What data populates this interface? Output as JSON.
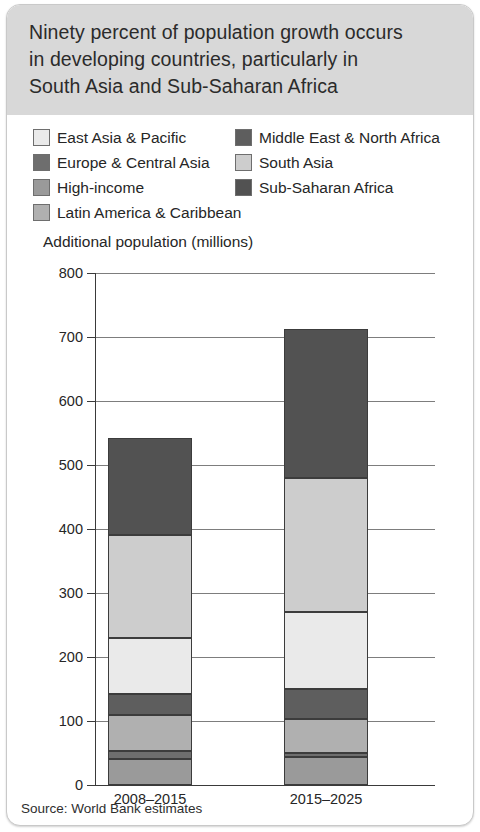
{
  "card": {
    "title": "Ninety percent of population growth occurs in developing countries, particularly in South Asia and Sub-Saharan Africa",
    "title_lines": [
      "Ninety percent of population growth occurs",
      "in developing countries, particularly in",
      "South Asia and Sub-Saharan Africa"
    ],
    "source": "Source: World Bank estimates",
    "title_band_color": "#d8d8d8"
  },
  "legend": {
    "left_column": [
      {
        "label": "East Asia & Pacific",
        "color": "#eaeaea"
      },
      {
        "label": "Europe & Central Asia",
        "color": "#6e6e6e"
      },
      {
        "label": "High-income",
        "color": "#9a9a9a"
      },
      {
        "label": "Latin America & Caribbean",
        "color": "#b0b0b0"
      }
    ],
    "right_column": [
      {
        "label": "Middle East & North Africa",
        "color": "#5e5e5e"
      },
      {
        "label": "South Asia",
        "color": "#cdcdcd"
      },
      {
        "label": "Sub-Saharan Africa",
        "color": "#525252"
      }
    ]
  },
  "chart_data": {
    "type": "bar",
    "subtype": "stacked",
    "title": "Ninety percent of population growth occurs in developing countries, particularly in South Asia and Sub-Saharan Africa",
    "ylabel": "Additional population (millions)",
    "xlabel": "",
    "ylim": [
      0,
      800
    ],
    "yticks": [
      0,
      100,
      200,
      300,
      400,
      500,
      600,
      700,
      800
    ],
    "ytick_labels": [
      "0",
      "100",
      "200",
      "300",
      "400",
      "500",
      "600",
      "700",
      "800"
    ],
    "grid": true,
    "legend_position": "top",
    "categories": [
      "2008–2015",
      "2015–2025"
    ],
    "series": [
      {
        "name": "High-income",
        "color": "#9a9a9a",
        "values": [
          40,
          43
        ]
      },
      {
        "name": "Europe & Central Asia",
        "color": "#6e6e6e",
        "values": [
          13,
          7
        ]
      },
      {
        "name": "Latin America & Caribbean",
        "color": "#b0b0b0",
        "values": [
          57,
          53
        ]
      },
      {
        "name": "Middle East & North Africa",
        "color": "#5e5e5e",
        "values": [
          32,
          47
        ]
      },
      {
        "name": "East Asia & Pacific",
        "color": "#eaeaea",
        "values": [
          88,
          120
        ]
      },
      {
        "name": "South Asia",
        "color": "#cdcdcd",
        "values": [
          161,
          210
        ]
      },
      {
        "name": "Sub-Saharan Africa",
        "color": "#525252",
        "values": [
          151,
          232
        ]
      }
    ],
    "totals": [
      542,
      712
    ]
  }
}
